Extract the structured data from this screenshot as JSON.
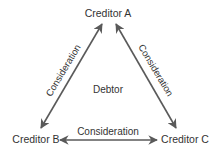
{
  "nodes": {
    "creditor_a": "Creditor A",
    "creditor_b": "Creditor B",
    "creditor_c": "Creditor C",
    "center": "Debtor"
  },
  "edges": {
    "a_b": "Consideration",
    "a_c": "Consideration",
    "b_c": "Consideration"
  },
  "colors": {
    "arrow": "#5a5a5a",
    "text": "#333333"
  }
}
